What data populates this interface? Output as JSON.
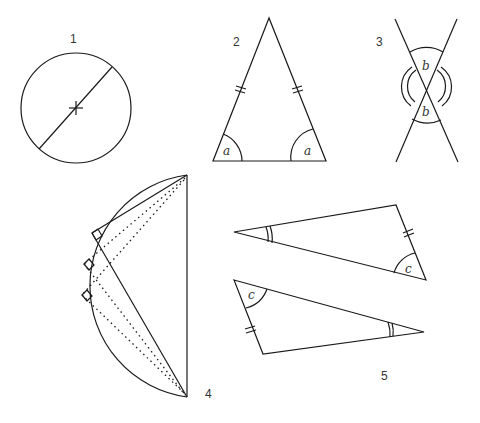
{
  "figures": [
    {
      "id": "1",
      "label": "1",
      "description": "Circle with diameter through centre"
    },
    {
      "id": "2",
      "label": "2",
      "description": "Isosceles triangle with equal base angles",
      "angle_labels": [
        "a",
        "a"
      ]
    },
    {
      "id": "3",
      "label": "3",
      "description": "Intersecting lines with vertically opposite angles",
      "angle_labels": [
        "b",
        "b"
      ]
    },
    {
      "id": "4",
      "label": "4",
      "description": "Semicircle with angles in a semicircle (right angles)"
    },
    {
      "id": "5",
      "label": "5",
      "description": "Two congruent triangles",
      "angle_labels": [
        "c",
        "c"
      ]
    }
  ],
  "colors": {
    "line": "#1a1a1a",
    "text": "#333333",
    "background": "#ffffff"
  }
}
